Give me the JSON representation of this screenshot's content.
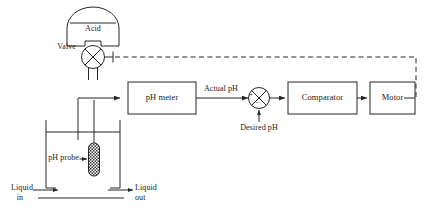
{
  "diagram": {
    "type": "process-control-block-diagram",
    "stroke_color": "#262626",
    "background": "#ffffff",
    "blocks": [
      {
        "id": "ph_meter",
        "label": "pH meter",
        "x": 128,
        "y": 82,
        "w": 68,
        "h": 32
      },
      {
        "id": "comparator",
        "label": "Comparator",
        "x": 288,
        "y": 82,
        "w": 69,
        "h": 32
      },
      {
        "id": "motor",
        "label": "Motor",
        "x": 370,
        "y": 82,
        "w": 45,
        "h": 32
      }
    ],
    "vessel": {
      "id": "acid_tank",
      "label": "Acid"
    },
    "valve": {
      "id": "control_valve",
      "label": "Valve"
    },
    "probe": {
      "id": "ph_probe",
      "label": "pH probe"
    },
    "summing_junction": {
      "id": "summing-junction",
      "plus_sign": "+",
      "minus_sign": "−"
    },
    "signals": {
      "actual_ph": "Actual pH",
      "desired_ph": "Desired pH",
      "liquid_in_line1": "Liquid",
      "liquid_in_line2": "in",
      "liquid_out_line1": "Liquid",
      "liquid_out_line2": "out"
    }
  }
}
